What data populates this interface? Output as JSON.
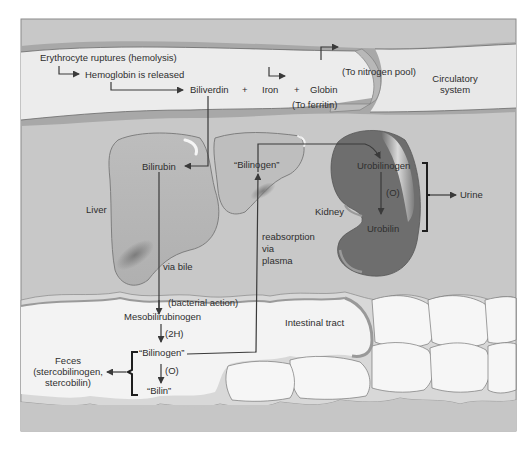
{
  "diagram": {
    "regions": {
      "circulatory": "Circulatory system",
      "circulatory_line1": "Circulatory",
      "circulatory_line2": "system",
      "liver": "Liver",
      "kidney": "Kidney",
      "intestine": "Intestinal tract"
    },
    "nodes": {
      "erythrocyte": "Erythrocyte ruptures (hemolysis)",
      "hemoglobin": "Hemoglobin is released",
      "biliverdin": "Biliverdin",
      "plus1": "+",
      "iron": "Iron",
      "plus2": "+",
      "globin": "Globin",
      "to_nitrogen": "(To nitrogen pool)",
      "to_ferritin": "(To ferritin)",
      "bilirubin": "Bilirubin",
      "bilinogen_liver": "“Bilinogen”",
      "urobilinogen": "Urobilinogen",
      "oxidation_kidney": "(O)",
      "urobilin": "Urobilin",
      "urine": "Urine",
      "mesobilirubinogen": "Mesobilirubinogen",
      "bilinogen_gut": "“Bilinogen”",
      "bilin": "“Bilin”",
      "feces_line1": "Feces",
      "feces_line2": "(stercobilinogen,",
      "feces_line3": "stercobilin)"
    },
    "edge_labels": {
      "via_bile": "via bile",
      "bacterial_action": "(bacterial action)",
      "two_h": "(2H)",
      "oxidation_gut": "(O)",
      "reabsorption_1": "reabsorption",
      "reabsorption_2": "via",
      "reabsorption_3": "plasma"
    },
    "colors": {
      "background": "#c9c9c9",
      "vessel_wall": "#a9a9a9",
      "vessel_lumen": "#ececec",
      "liver": "#b9b9b9",
      "kidney": "#6f6f6f",
      "intestine": "#f3f3f3",
      "intestine_wall": "#d9d9d9",
      "line": "#3a3a3a"
    }
  }
}
